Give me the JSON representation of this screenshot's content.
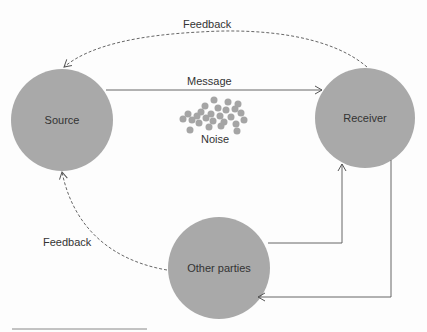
{
  "diagram": {
    "colors": {
      "node": "#a9a9a9",
      "line": "#555555",
      "noise": "#a5a5a5",
      "background": "#fdfdfd",
      "text": "#333333"
    },
    "nodes": [
      {
        "id": "source",
        "label": "Source",
        "cx": 62,
        "cy": 120,
        "r": 51
      },
      {
        "id": "receiver",
        "label": "Receiver",
        "cx": 365,
        "cy": 118,
        "r": 50
      },
      {
        "id": "other",
        "label": "Other parties",
        "cx": 219,
        "cy": 268,
        "r": 51
      }
    ],
    "edges": [
      {
        "id": "message",
        "label": "Message",
        "style": "solid"
      },
      {
        "id": "feedback-top",
        "label": "Feedback",
        "style": "dashed"
      },
      {
        "id": "feedback-left",
        "label": "Feedback",
        "style": "dashed"
      },
      {
        "id": "other-to-receiver",
        "label": "",
        "style": "solid"
      },
      {
        "id": "receiver-to-other",
        "label": "",
        "style": "solid"
      }
    ],
    "noise": {
      "label": "Noise"
    }
  }
}
